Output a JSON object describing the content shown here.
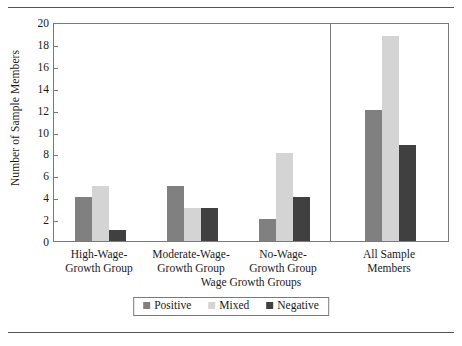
{
  "chart_data": {
    "type": "bar",
    "title": "",
    "xlabel": "Wage Growth Groups",
    "ylabel": "Number of Sample Members",
    "ylim": [
      0,
      20
    ],
    "ytick_step": 2,
    "yticks": [
      "0",
      "2",
      "4",
      "6",
      "8",
      "10",
      "12",
      "14",
      "16",
      "18",
      "20"
    ],
    "grid": false,
    "legend_position": "bottom-center",
    "categories": [
      "High-Wage-Growth Group",
      "Moderate-Wage-Growth Group",
      "No-Wage-Growth Group",
      "All Sample Members"
    ],
    "category_lines": [
      [
        "High-Wage-",
        "Growth Group"
      ],
      [
        "Moderate-Wage-",
        "Growth Group"
      ],
      [
        "No-Wage-",
        "Growth Group"
      ],
      [
        "All Sample",
        "Members"
      ]
    ],
    "series": [
      {
        "name": "Positive",
        "color": "#808080",
        "values": [
          4,
          5,
          2,
          12
        ]
      },
      {
        "name": "Mixed",
        "color": "#d4d4d4",
        "values": [
          5,
          3,
          8,
          18.7
        ]
      },
      {
        "name": "Negative",
        "color": "#404040",
        "values": [
          1,
          3,
          4,
          8.8
        ]
      }
    ],
    "separator_after_category_index": 2,
    "annotations": []
  },
  "legend": {
    "items": [
      {
        "label": "Positive",
        "color": "#808080"
      },
      {
        "label": "Mixed",
        "color": "#d4d4d4"
      },
      {
        "label": "Negative",
        "color": "#404040"
      }
    ]
  }
}
